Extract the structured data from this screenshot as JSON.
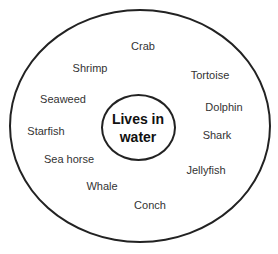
{
  "diagram": {
    "center": {
      "line1": "Lives in",
      "line2": "water"
    },
    "items": [
      {
        "label": "Crab",
        "x": 143,
        "y": 46
      },
      {
        "label": "Shrimp",
        "x": 90,
        "y": 68
      },
      {
        "label": "Tortoise",
        "x": 210,
        "y": 75
      },
      {
        "label": "Seaweed",
        "x": 63,
        "y": 99
      },
      {
        "label": "Dolphin",
        "x": 224,
        "y": 107
      },
      {
        "label": "Starfish",
        "x": 46,
        "y": 131
      },
      {
        "label": "Shark",
        "x": 217,
        "y": 135
      },
      {
        "label": "Sea horse",
        "x": 69,
        "y": 159
      },
      {
        "label": "Jellyfish",
        "x": 206,
        "y": 170
      },
      {
        "label": "Whale",
        "x": 102,
        "y": 186
      },
      {
        "label": "Conch",
        "x": 150,
        "y": 205
      }
    ]
  }
}
